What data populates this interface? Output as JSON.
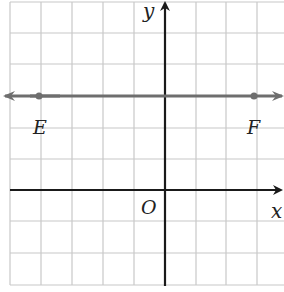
{
  "diagram": {
    "type": "coordinate-plane",
    "grid": {
      "spacing_px": 31.3,
      "columns": 9,
      "rows": 9
    },
    "axes": {
      "x_label": "x",
      "y_label": "y",
      "origin_label": "O"
    },
    "line": {
      "name": "EF",
      "description": "horizontal line through E and F, arrows both directions",
      "y_value": 3,
      "color": "#6e6e6e"
    },
    "points": [
      {
        "label": "E",
        "x": -4,
        "y": 3
      },
      {
        "label": "F",
        "x": 3,
        "y": 3
      }
    ],
    "colors": {
      "grid": "#c8c8c8",
      "axis": "#1a1a1a",
      "line": "#6e6e6e"
    }
  }
}
